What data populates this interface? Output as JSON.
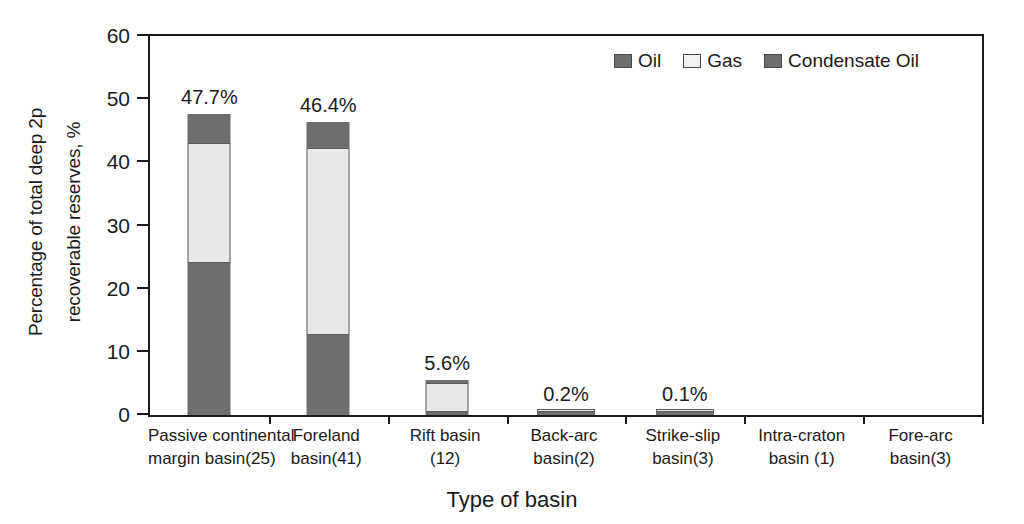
{
  "chart_data": {
    "type": "bar",
    "subtype": "stacked-bar",
    "title": "",
    "xlabel": "Type of basin",
    "ylabel": "Percentage of total deep 2p recoverable reserves, %",
    "ylabel_lines": [
      "Percentage of total deep 2p",
      "recoverable reserves, %"
    ],
    "ylim": [
      0,
      60
    ],
    "yticks": [
      0,
      10,
      20,
      30,
      40,
      50,
      60
    ],
    "ytick_labels": [
      "0",
      "10",
      "20",
      "30",
      "40",
      "50",
      "60"
    ],
    "grid": false,
    "legend_position": "top-right",
    "categories": [
      "Passive continental margin basin(25)",
      "Foreland basin(41)",
      "Rift basin (12)",
      "Back-arc basin(2)",
      "Strike-slip basin(3)",
      "Intra-craton basin (1)",
      "Fore-arc basin(3)"
    ],
    "category_lines": [
      [
        "Passive continental",
        "margin  basin(25)"
      ],
      [
        "Foreland",
        "basin(41)"
      ],
      [
        "Rift basin",
        "(12)"
      ],
      [
        "Back-arc",
        "basin(2)"
      ],
      [
        "Strike-slip",
        "basin(3)"
      ],
      [
        "Intra-craton",
        "basin (1)"
      ],
      [
        "Fore-arc",
        "basin(3)"
      ]
    ],
    "series": [
      {
        "name": "Oil",
        "color": "#6e6e6e",
        "values": [
          24.0,
          12.7,
          0.5,
          0.1,
          0.05,
          0,
          0
        ]
      },
      {
        "name": "Gas",
        "color": "#e8e8e8",
        "values": [
          19.0,
          29.6,
          4.6,
          0.1,
          0.05,
          0,
          0
        ]
      },
      {
        "name": "Condensate Oil",
        "color": "#6e6e6e",
        "values": [
          4.7,
          4.1,
          0.5,
          0.0,
          0.0,
          0,
          0
        ]
      }
    ],
    "totals": [
      47.7,
      46.4,
      5.6,
      0.2,
      0.1,
      0,
      0
    ],
    "value_labels": [
      "47.7%",
      "46.4%",
      "5.6%",
      "0.2%",
      "0.1%",
      "",
      ""
    ]
  },
  "legend": {
    "items": [
      {
        "label": "Oil",
        "swatch": "oil"
      },
      {
        "label": "Gas",
        "swatch": "gas"
      },
      {
        "label": "Condensate Oil",
        "swatch": "condensate"
      }
    ]
  },
  "axes": {
    "y_title_line1": "Percentage of total deep 2p",
    "y_title_line2": "recoverable reserves, %",
    "x_title": "Type of basin"
  },
  "colors": {
    "oil": "#6e6e6e",
    "gas": "#e8e8e8",
    "condensate": "#6e6e6e",
    "axis": "#1a1a1a",
    "background": "#ffffff"
  }
}
